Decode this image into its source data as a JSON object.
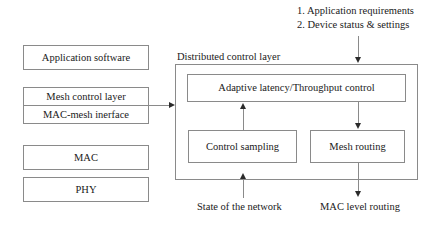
{
  "diagram": {
    "background_color": "#ffffff",
    "line_color": "#8a8a8a",
    "arrow_color": "#2b2b2b",
    "text_color": "#1a1a1a"
  },
  "stack": {
    "name": "protocol-stack",
    "boxes": [
      {
        "id": "application-software",
        "label": "Application software"
      },
      {
        "id": "mesh-control-layer",
        "label": "Mesh control layer"
      },
      {
        "id": "mac-mesh-interface",
        "label": "MAC-mesh inerface"
      },
      {
        "id": "mac",
        "label": "MAC"
      },
      {
        "id": "phy",
        "label": "PHY"
      }
    ]
  },
  "control_layer": {
    "title": "Distributed control layer",
    "boxes": [
      {
        "id": "adaptive-latency-throughput-control",
        "label": "Adaptive latency/Throughput control"
      },
      {
        "id": "control-sampling",
        "label": "Control sampling"
      },
      {
        "id": "mesh-routing",
        "label": "Mesh routing"
      }
    ]
  },
  "inputs": {
    "top_lines": [
      "1. Application requirements",
      "2. Device status & settings"
    ],
    "bottom_left": "State of the network"
  },
  "outputs": {
    "bottom_right": "MAC level routing"
  }
}
